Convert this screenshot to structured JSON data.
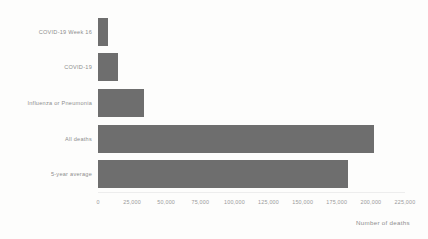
{
  "chart_data": {
    "type": "bar",
    "orientation": "horizontal",
    "title": "",
    "subtitle": "",
    "xlabel": "Number of deaths",
    "ylabel": "",
    "categories": [
      "COVID-19 Week 16",
      "COVID-19",
      "Influenza or Pneumonia",
      "All deaths",
      "5-year average"
    ],
    "values": [
      7300,
      15000,
      34000,
      202000,
      183000
    ],
    "xlim": [
      0,
      225000
    ],
    "xticks": [
      0,
      25000,
      50000,
      75000,
      100000,
      125000,
      150000,
      175000,
      200000,
      225000
    ],
    "xtick_labels": [
      "0",
      "25,000",
      "50,000",
      "75,000",
      "100,000",
      "125,000",
      "150,000",
      "175,000",
      "200,000",
      "225,000"
    ],
    "grid": false,
    "legend": null,
    "annotations": [],
    "colors": {
      "bar": "#6e6e6e",
      "background": "#fdfdfc",
      "tick_text": "#9a9a9a",
      "category_text": "#8d8d8d",
      "axis_line": "#ededed"
    }
  }
}
